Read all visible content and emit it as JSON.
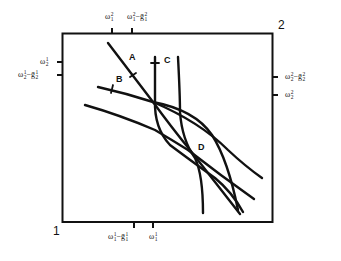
{
  "diagram": {
    "type": "edgeworth-box",
    "corners": {
      "origin_1": "1",
      "origin_2": "2"
    },
    "top_axis_labels": [
      {
        "base": "ω",
        "sup": "2",
        "sub": "1",
        "suffix": ""
      },
      {
        "base": "ω",
        "sup": "2",
        "sub": "1",
        "suffix": "−ḡ",
        "suffix_sup": "2",
        "suffix_sub": "1"
      }
    ],
    "bottom_axis_labels": [
      {
        "base": "ω",
        "sup": "1",
        "sub": "1",
        "suffix": "−ḡ",
        "suffix_sup": "1",
        "suffix_sub": "1"
      },
      {
        "base": "ω",
        "sup": "1",
        "sub": "1",
        "suffix": ""
      }
    ],
    "left_axis_labels": [
      {
        "base": "ω",
        "sup": "1",
        "sub": "2",
        "suffix": ""
      },
      {
        "base": "ω",
        "sup": "1",
        "sub": "2",
        "suffix": "−ḡ",
        "suffix_sup": "1",
        "suffix_sub": "2"
      }
    ],
    "right_axis_labels": [
      {
        "base": "ω",
        "sup": "2",
        "sub": "2",
        "suffix": "−ḡ",
        "suffix_sup": "2",
        "suffix_sub": "2"
      },
      {
        "base": "ω",
        "sup": "2",
        "sub": "2",
        "suffix": ""
      }
    ],
    "point_labels": {
      "A": "A",
      "B": "B",
      "C": "C",
      "D": "D"
    },
    "colors": {
      "ink": "#111111",
      "background": "#ffffff"
    }
  }
}
